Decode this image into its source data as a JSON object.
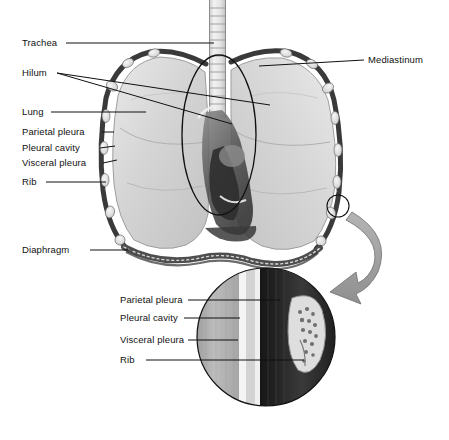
{
  "figure": {
    "type": "anatomical-illustration",
    "background": "#ffffff",
    "leader_line_color": "#1a1a1a",
    "tissue_colors": {
      "lung": "#cfcfcf",
      "lung_highlight": "#e6e6e6",
      "rib_cage_border": "#3b3b3b",
      "rib_oval": "#efefef",
      "mediastinum_dark": "#4a4a4a",
      "heart_shadow": "#5a5a5a",
      "trachea": "#e8e8e8",
      "diaphragm": "#555555",
      "arrow": "#9a9a9a",
      "inset_parietal": "#b9b9b9",
      "inset_cavity": "#f2f2f2",
      "inset_visceral": "#cfcfcf",
      "inset_dark_band": "#2a2a2a",
      "inset_rib": "#dcdcdc"
    }
  },
  "main_labels": {
    "trachea": "Trachea",
    "hilum": "Hilum",
    "lung": "Lung",
    "parietal_pleura": "Parietal pleura",
    "pleural_cavity": "Pleural cavity",
    "visceral_pleura": "Visceral pleura",
    "rib": "Rib",
    "diaphragm": "Diaphragm",
    "mediastinum": "Mediastinum"
  },
  "inset_labels": {
    "parietal_pleura": "Parietal pleura",
    "pleural_cavity": "Pleural cavity",
    "visceral_pleura": "Visceral pleura",
    "rib": "Rib"
  }
}
